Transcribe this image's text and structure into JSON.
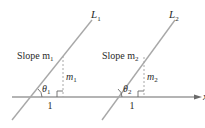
{
  "diagram": {
    "colors": {
      "line": "#a8a8a8",
      "axis": "#6a6a6a",
      "text": "#2a2a2a"
    },
    "axis": {
      "label": "x"
    },
    "lines": [
      {
        "name": "L",
        "subscript": "1",
        "slope_label": "Slope m",
        "slope_sub": "1",
        "rise_label": "m",
        "rise_sub": "1",
        "run_label": "1",
        "angle_label": "θ",
        "angle_sub": "1"
      },
      {
        "name": "L",
        "subscript": "2",
        "slope_label": "Slope m",
        "slope_sub": "2",
        "rise_label": "m",
        "rise_sub": "2",
        "run_label": "1",
        "angle_label": "θ",
        "angle_sub": "2"
      }
    ]
  }
}
